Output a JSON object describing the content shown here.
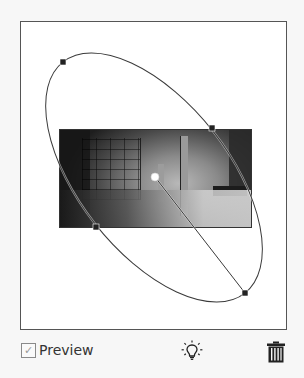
{
  "panel": {
    "name": "Radial Filter Preview",
    "preview": {
      "label": "Preview",
      "checked": true,
      "check_glyph": "✓"
    },
    "icons": {
      "show_hide": "lightbulb-icon",
      "delete": "trash-icon"
    }
  },
  "canvas": {
    "background": "#ffffff",
    "border_color": "#555555",
    "photo": {
      "description": "Dim interior room photo with shelving and pillar",
      "x": 58,
      "y": 128,
      "width": 191,
      "height": 97
    },
    "ellipse": {
      "center": [
        154,
        177
      ],
      "rx": 147,
      "ry": 76,
      "rotation_deg": 51.8,
      "stroke": "#444444",
      "handles": [
        [
          63,
          62
        ],
        [
          212,
          128
        ],
        [
          96,
          227
        ],
        [
          245,
          293
        ]
      ],
      "center_pin": [
        155,
        177
      ]
    }
  }
}
